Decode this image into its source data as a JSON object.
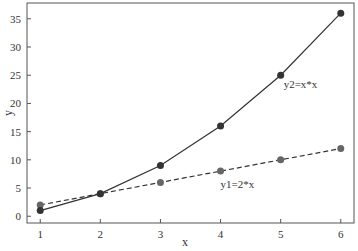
{
  "chart_data": {
    "type": "line",
    "title": "",
    "xlabel": "x",
    "ylabel": "y",
    "x": [
      1,
      2,
      3,
      4,
      5,
      6
    ],
    "xlim": [
      0.78,
      6.22
    ],
    "ylim": [
      -1.2,
      37.8
    ],
    "xticks": [
      1,
      2,
      3,
      4,
      5,
      6
    ],
    "yticks": [
      0,
      5,
      10,
      15,
      20,
      25,
      30,
      35
    ],
    "grid": false,
    "legend": null,
    "series": [
      {
        "name": "y2=x*x",
        "values": [
          1,
          4,
          9,
          16,
          25,
          36
        ],
        "color": "#333333",
        "linestyle": "solid",
        "marker": "circle",
        "marker_color": "#333333"
      },
      {
        "name": "y1=2*x",
        "values": [
          2,
          4,
          6,
          8,
          10,
          12
        ],
        "color": "#333333",
        "linestyle": "dashed",
        "marker": "circle",
        "marker_color": "#666666"
      }
    ],
    "annotations": [
      {
        "text": "y2=x*x",
        "x": 5.05,
        "y": 22.8
      },
      {
        "text": "y1=2*x",
        "x": 4.0,
        "y": 5.0
      }
    ]
  }
}
